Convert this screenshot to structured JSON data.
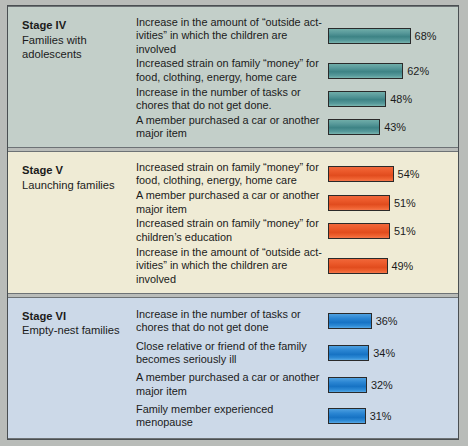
{
  "chart_data": {
    "type": "bar",
    "title": "",
    "xlabel": "",
    "ylabel": "",
    "xlim": [
      0,
      100
    ],
    "grid": false,
    "legend": "none",
    "value_suffix": "%",
    "groups": [
      {
        "stage_title": "Stage IV",
        "stage_subtitle": "Families with adolescents",
        "bar_color": "#3d8385",
        "background": "#c3cfc9",
        "categories": [
          "Increase in the amount of “outside act-ivities” in which the children are involved",
          "Increased strain on family “money” for food, clothing, energy, home care",
          "Increase in the number of tasks or chores that do not get done.",
          "A member purchased a car or another major item"
        ],
        "values": [
          68,
          62,
          48,
          43
        ],
        "labels": [
          "68%",
          "62%",
          "48%",
          "43%"
        ]
      },
      {
        "stage_title": "Stage V",
        "stage_subtitle": "Launching families",
        "bar_color": "#e14c1e",
        "background": "#efebd5",
        "categories": [
          "Increased strain on family “money” for food, clothing, energy, home care",
          "A member purchased a car or another major item",
          "Increased strain on family “money” for children’s education",
          "Increase in the amount of “outside act-ivities” in which the children are involved"
        ],
        "values": [
          54,
          51,
          51,
          49
        ],
        "labels": [
          "54%",
          "51%",
          "51%",
          "49%"
        ]
      },
      {
        "stage_title": "Stage VI",
        "stage_subtitle": "Empty-nest families",
        "bar_color": "#1773c4",
        "background": "#ccd9e8",
        "categories": [
          "Increase in the number of tasks or chores that do not get done",
          "Close relative or friend of the family becomes seriously ill",
          "A member purchased a car or another major item",
          "Family member experienced menopause"
        ],
        "values": [
          36,
          34,
          32,
          31
        ],
        "labels": [
          "36%",
          "34%",
          "32%",
          "31%"
        ]
      }
    ]
  }
}
